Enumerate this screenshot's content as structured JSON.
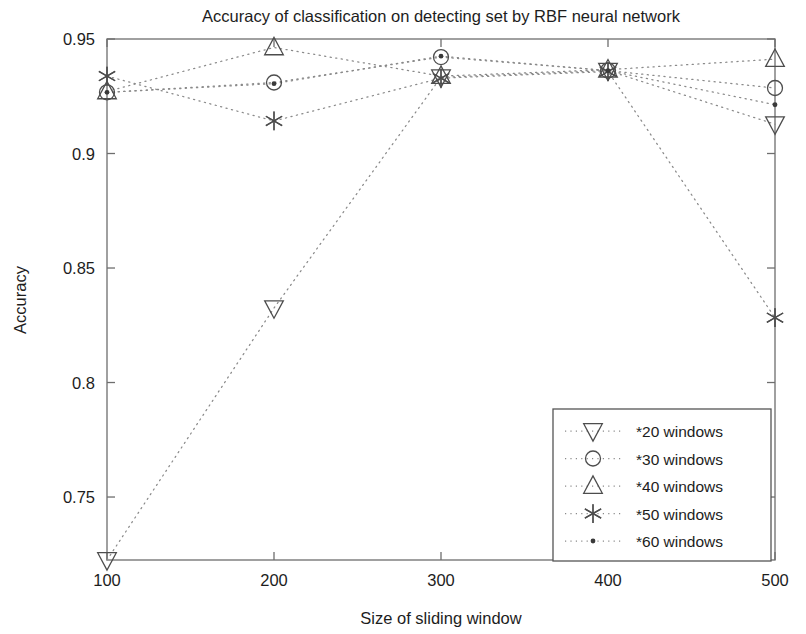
{
  "chart_data": {
    "type": "line",
    "title": "Accuracy of classification on detecting set by RBF neural network",
    "xlabel": "Size of sliding window",
    "ylabel": "Accuracy",
    "x": [
      100,
      200,
      300,
      400,
      500
    ],
    "xticklabels": [
      "100",
      "200",
      "300",
      "400",
      "500"
    ],
    "yticks": [
      0.75,
      0.8,
      0.85,
      0.9,
      0.95
    ],
    "yticklabels": [
      "0.75",
      "0.8",
      "0.85",
      "0.9",
      "0.95"
    ],
    "xlim": [
      100,
      500
    ],
    "ylim": [
      0.7225,
      0.95
    ],
    "grid": false,
    "legend_position": "lower right",
    "marker_color": "#4d4d4d",
    "line_color": "#8a8a8a",
    "series": [
      {
        "name": "*20 windows",
        "marker": "triangle-down",
        "values": [
          0.7225,
          0.8325,
          0.9333,
          0.9362,
          0.9128
        ]
      },
      {
        "name": "*30 windows",
        "marker": "circle",
        "values": [
          0.9267,
          0.931,
          0.9421,
          0.9362,
          0.9286
        ]
      },
      {
        "name": "*40 windows",
        "marker": "triangle-up",
        "values": [
          0.9271,
          0.9463,
          0.9338,
          0.9366,
          0.9412
        ]
      },
      {
        "name": "*50 windows",
        "marker": "asterisk",
        "values": [
          0.9338,
          0.9142,
          0.9329,
          0.9358,
          0.8283
        ]
      },
      {
        "name": "*60 windows",
        "marker": "dot",
        "values": [
          0.9267,
          0.9305,
          0.9425,
          0.9362,
          0.9213
        ]
      }
    ]
  },
  "legend": {
    "items": [
      {
        "label": "*20 windows",
        "marker": "triangle-down"
      },
      {
        "label": "*30 windows",
        "marker": "circle"
      },
      {
        "label": "*40 windows",
        "marker": "triangle-up"
      },
      {
        "label": "*50 windows",
        "marker": "asterisk"
      },
      {
        "label": "*60 windows",
        "marker": "dot"
      }
    ]
  }
}
